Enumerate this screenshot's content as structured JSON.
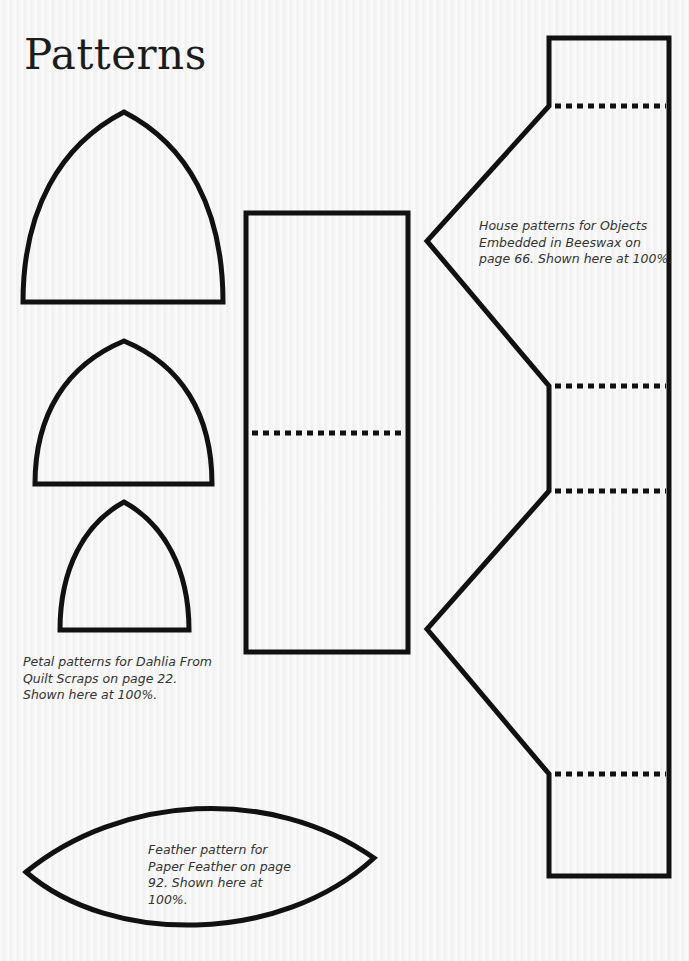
{
  "page": {
    "title": "Patterns"
  },
  "captions": {
    "petal": "Petal patterns for Dahlia From\nQuilt Scraps on page 22.\nShown here at 100%.",
    "house": "House patterns for Objects\nEmbedded in Beeswax on\npage 66. Shown here at 100%.",
    "feather": "Feather pattern for\nPaper Feather on page\n92. Shown here at\n100%."
  },
  "patterns": {
    "stroke_color": "#111111",
    "petals": [
      {
        "name": "large",
        "tip": [
          124,
          112
        ],
        "base_left": [
          23,
          302
        ],
        "base_right": [
          223,
          302
        ]
      },
      {
        "name": "medium",
        "tip": [
          124,
          341
        ],
        "base_left": [
          35,
          484
        ],
        "base_right": [
          212,
          484
        ]
      },
      {
        "name": "small",
        "tip": [
          124,
          502
        ],
        "base_left": [
          60,
          630
        ],
        "base_right": [
          189,
          630
        ]
      }
    ],
    "rectangle": {
      "x": 246,
      "y": 213,
      "width": 162,
      "height": 439,
      "fold_line_y": 433
    },
    "house": {
      "fold_lines_y": [
        106,
        386,
        491,
        774
      ]
    },
    "feather": {
      "left_tip": [
        26,
        872
      ],
      "right_tip": [
        374,
        858
      ]
    }
  }
}
